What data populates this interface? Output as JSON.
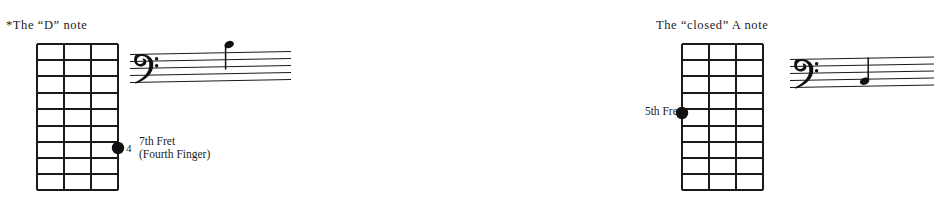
{
  "page": {
    "width": 649,
    "height": 207,
    "background": "#ffffff",
    "ink_color": "#1a1a1a"
  },
  "panels": [
    {
      "id": "d-note",
      "caption": "*The “D” note",
      "fretboard": {
        "strings": 4,
        "frets": 9,
        "marker": {
          "string_index": 3,
          "fret_index": 7,
          "finger_number": "4",
          "label_line_1": "7th Fret",
          "label_line_2": "(Fourth Finger)"
        }
      },
      "staff": {
        "clef": "bass-clef",
        "lines": 5,
        "note": {
          "name": "D",
          "duration": "quarter",
          "stem_direction": "down",
          "position": "above-top-line"
        }
      }
    },
    {
      "id": "closed-a-note",
      "caption": "The “closed” A note",
      "fretboard": {
        "strings": 4,
        "frets": 9,
        "marker": {
          "string_index": 0,
          "fret_index": 5,
          "finger_number": "",
          "label_line_1": "5th",
          "label_line_2": "Fret"
        }
      },
      "staff": {
        "clef": "bass-clef",
        "lines": 5,
        "note": {
          "name": "A",
          "duration": "quarter",
          "stem_direction": "up",
          "position": "space-below-second-line"
        }
      }
    }
  ]
}
